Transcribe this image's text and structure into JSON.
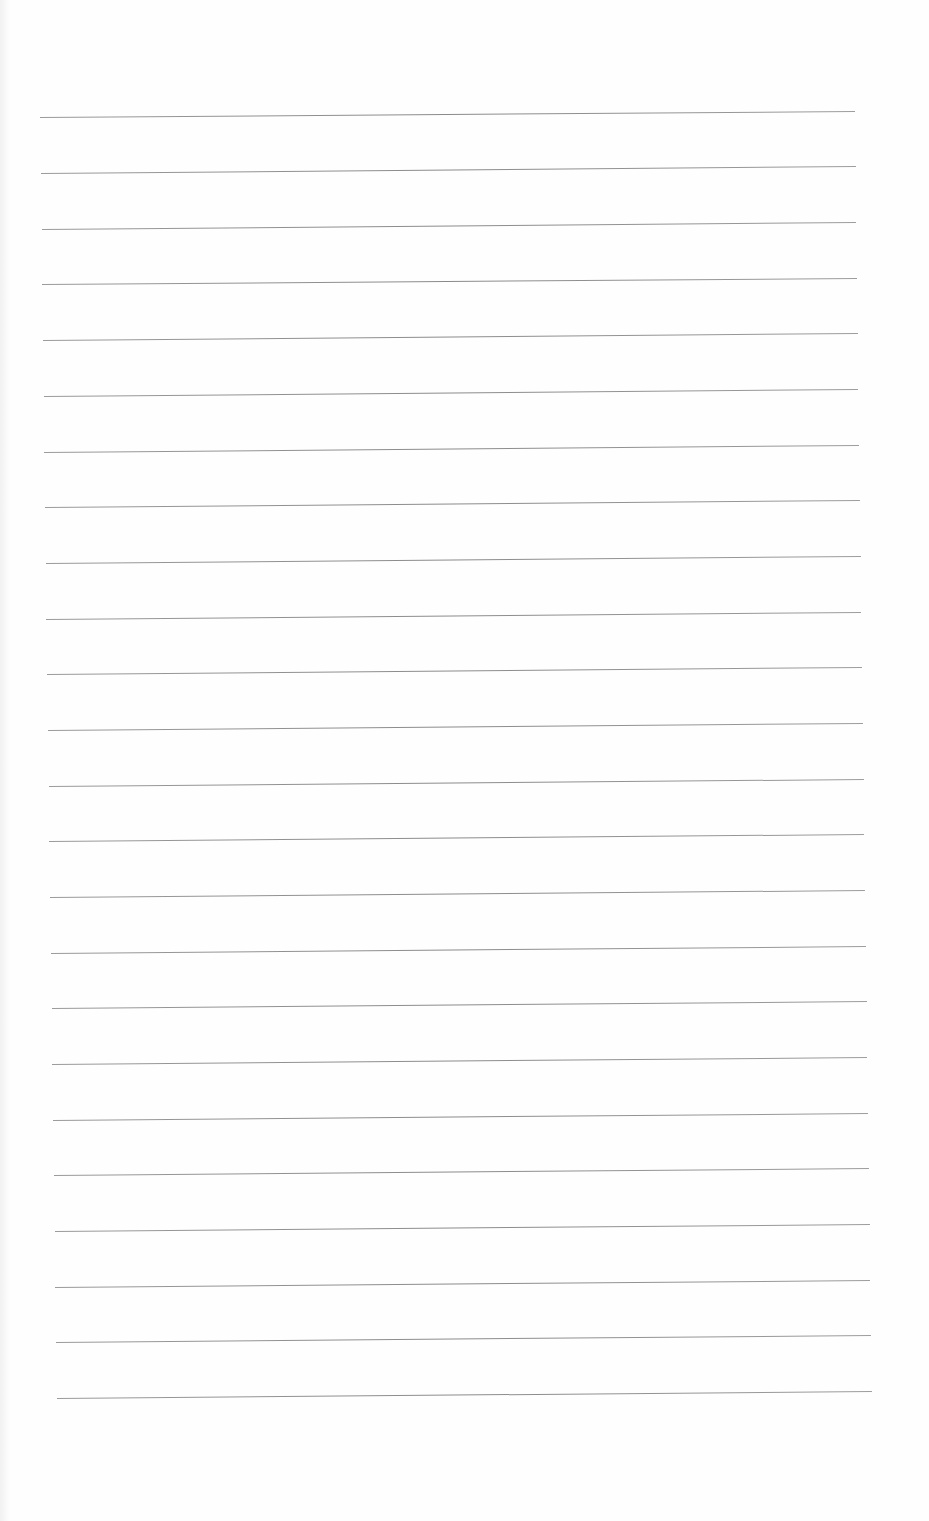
{
  "document": {
    "type": "blank lined paper",
    "background_color": "#fefefe",
    "line_color": "#8f8f8f",
    "line_count": 24,
    "lines": [
      {
        "index": 1,
        "x1": 40,
        "y1": 117,
        "x2": 855,
        "y2": 111
      },
      {
        "index": 2,
        "x1": 41,
        "y1": 173,
        "x2": 856,
        "y2": 166
      },
      {
        "index": 3,
        "x1": 42,
        "y1": 229,
        "x2": 856,
        "y2": 222
      },
      {
        "index": 4,
        "x1": 42,
        "y1": 284,
        "x2": 857,
        "y2": 278
      },
      {
        "index": 5,
        "x1": 43,
        "y1": 340,
        "x2": 858,
        "y2": 333
      },
      {
        "index": 6,
        "x1": 44,
        "y1": 396,
        "x2": 858,
        "y2": 389
      },
      {
        "index": 7,
        "x1": 44,
        "y1": 452,
        "x2": 859,
        "y2": 445
      },
      {
        "index": 8,
        "x1": 45,
        "y1": 507,
        "x2": 860,
        "y2": 500
      },
      {
        "index": 9,
        "x1": 46,
        "y1": 563,
        "x2": 861,
        "y2": 556
      },
      {
        "index": 10,
        "x1": 46,
        "y1": 619,
        "x2": 861,
        "y2": 612
      },
      {
        "index": 11,
        "x1": 47,
        "y1": 674,
        "x2": 862,
        "y2": 667
      },
      {
        "index": 12,
        "x1": 48,
        "y1": 730,
        "x2": 863,
        "y2": 723
      },
      {
        "index": 13,
        "x1": 49,
        "y1": 786,
        "x2": 864,
        "y2": 779
      },
      {
        "index": 14,
        "x1": 49,
        "y1": 841,
        "x2": 864,
        "y2": 834
      },
      {
        "index": 15,
        "x1": 50,
        "y1": 897,
        "x2": 865,
        "y2": 890
      },
      {
        "index": 16,
        "x1": 51,
        "y1": 953,
        "x2": 866,
        "y2": 946
      },
      {
        "index": 17,
        "x1": 52,
        "y1": 1008,
        "x2": 867,
        "y2": 1001
      },
      {
        "index": 18,
        "x1": 52,
        "y1": 1064,
        "x2": 867,
        "y2": 1057
      },
      {
        "index": 19,
        "x1": 53,
        "y1": 1120,
        "x2": 868,
        "y2": 1113
      },
      {
        "index": 20,
        "x1": 54,
        "y1": 1175,
        "x2": 869,
        "y2": 1168
      },
      {
        "index": 21,
        "x1": 55,
        "y1": 1231,
        "x2": 870,
        "y2": 1224
      },
      {
        "index": 22,
        "x1": 55,
        "y1": 1287,
        "x2": 870,
        "y2": 1280
      },
      {
        "index": 23,
        "x1": 56,
        "y1": 1342,
        "x2": 871,
        "y2": 1335
      },
      {
        "index": 24,
        "x1": 57,
        "y1": 1398,
        "x2": 872,
        "y2": 1391
      }
    ]
  }
}
